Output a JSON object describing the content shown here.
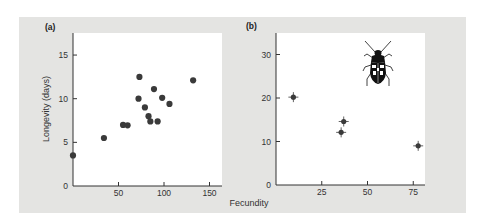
{
  "chart_data": [
    {
      "panel": "(a)",
      "type": "scatter",
      "xlabel": "Fecundity",
      "ylabel": "Longevity (days)",
      "xlim": [
        0,
        165
      ],
      "ylim": [
        0,
        17
      ],
      "xticks": [
        50,
        100,
        150
      ],
      "yticks": [
        0,
        5,
        10,
        15
      ],
      "grid": false,
      "points": [
        {
          "x": 0,
          "y": 3.5
        },
        {
          "x": 34,
          "y": 5.5
        },
        {
          "x": 55,
          "y": 7.0
        },
        {
          "x": 60,
          "y": 6.95
        },
        {
          "x": 72,
          "y": 10.0
        },
        {
          "x": 73,
          "y": 12.5
        },
        {
          "x": 79,
          "y": 9.0
        },
        {
          "x": 83,
          "y": 8.0
        },
        {
          "x": 85,
          "y": 7.4
        },
        {
          "x": 89,
          "y": 11.1
        },
        {
          "x": 93,
          "y": 7.4
        },
        {
          "x": 98,
          "y": 10.1
        },
        {
          "x": 106,
          "y": 9.4
        },
        {
          "x": 132,
          "y": 12.1
        }
      ]
    },
    {
      "panel": "(b)",
      "type": "scatter",
      "xlabel": "Fecundity",
      "ylabel": "",
      "xlim": [
        0,
        82
      ],
      "ylim": [
        0,
        35
      ],
      "xticks": [
        25,
        50,
        75
      ],
      "yticks": [
        0,
        10,
        20,
        30
      ],
      "grid": false,
      "error_bars": true,
      "annotation": "beetle illustration",
      "points": [
        {
          "x": 9.5,
          "y": 20.2
        },
        {
          "x": 35.6,
          "y": 12.1
        },
        {
          "x": 37,
          "y": 14.6
        },
        {
          "x": 77.7,
          "y": 9.0
        }
      ]
    }
  ],
  "labels": {
    "panel_a": "(a)",
    "panel_b": "(b)",
    "xlabel": "Fecundity",
    "ylabel": "Longevity (days)"
  },
  "colors": {
    "panel_bg": "#e4e4e2",
    "plot_bg": "#ffffff",
    "marker": "#3a3a3a",
    "axis": "#333333"
  }
}
